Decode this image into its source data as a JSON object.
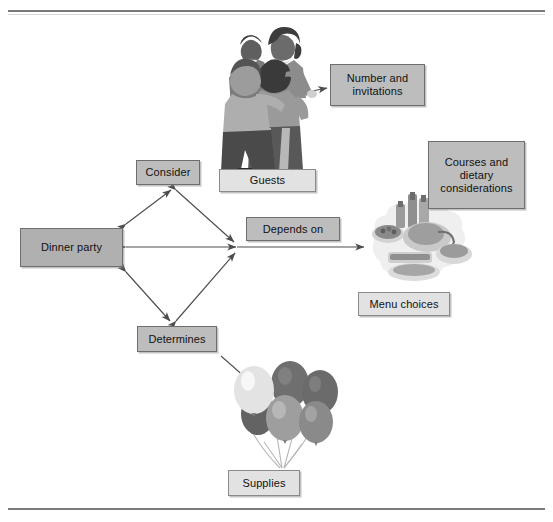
{
  "page": {
    "background": "#ffffff",
    "border_color": "#7a7a7a"
  },
  "diagram": {
    "type": "concept-map",
    "nodes": [
      {
        "id": "dinner-party",
        "label": "Dinner party",
        "shape": "rectangle",
        "fill": "#b0b0b0",
        "x": 20,
        "y": 228,
        "w": 103,
        "h": 39
      },
      {
        "id": "consider",
        "label": "Consider",
        "shape": "rectangle",
        "fill": "#bdbdbd",
        "x": 136,
        "y": 160,
        "w": 64,
        "h": 25
      },
      {
        "id": "determines",
        "label": "Determines",
        "shape": "rectangle",
        "fill": "#bdbdbd",
        "x": 137,
        "y": 326,
        "w": 80,
        "h": 26
      },
      {
        "id": "depends-on",
        "label": "Depends on",
        "shape": "rectangle",
        "fill": "#bdbdbd",
        "x": 246,
        "y": 217,
        "w": 94,
        "h": 24
      },
      {
        "id": "guests",
        "label": "Guests",
        "shape": "rectangle",
        "fill": "#e2e2e2",
        "x": 219,
        "y": 169,
        "w": 97,
        "h": 23
      },
      {
        "id": "number-and-invitations",
        "label": "Number and invitations",
        "lines": [
          "Number and",
          "invitations"
        ],
        "shape": "rectangle",
        "fill": "#bdbdbd",
        "x": 330,
        "y": 64,
        "w": 95,
        "h": 42
      },
      {
        "id": "courses-and-dietary-considerations",
        "label": "Courses and dietary considerations",
        "lines": [
          "Courses and",
          "dietary",
          "considerations"
        ],
        "shape": "rectangle",
        "fill": "#bdbdbd",
        "x": 428,
        "y": 141,
        "w": 97,
        "h": 68
      },
      {
        "id": "menu-choices",
        "label": "Menu choices",
        "shape": "rectangle",
        "fill": "#e2e2e2",
        "x": 358,
        "y": 292,
        "w": 92,
        "h": 24
      },
      {
        "id": "supplies",
        "label": "Supplies",
        "shape": "rectangle",
        "fill": "#e2e2e2",
        "x": 228,
        "y": 470,
        "w": 72,
        "h": 26
      }
    ],
    "edges": [
      {
        "from": "dinner-party",
        "to": "consider",
        "style": "double-arrow"
      },
      {
        "from": "dinner-party",
        "to": "determines",
        "style": "double-arrow"
      },
      {
        "from": "dinner-party",
        "to": "hub",
        "style": "double-arrow",
        "label": "Depends on"
      },
      {
        "from": "consider",
        "to": "hub",
        "style": "double-arrow"
      },
      {
        "from": "determines",
        "to": "hub",
        "style": "double-arrow"
      },
      {
        "from": "guests-image",
        "to": "number-and-invitations",
        "style": "single-arrow"
      },
      {
        "from": "hub",
        "to": "food-image",
        "style": "single-arrow"
      },
      {
        "from": "determines",
        "to": "balloons-image",
        "style": "single-arrow"
      }
    ],
    "images": [
      {
        "id": "guests-image",
        "alt": "illustration of four party guests",
        "x": 216,
        "y": 12,
        "w": 110,
        "h": 160
      },
      {
        "id": "food-image",
        "alt": "illustration of a platter of food and bottles",
        "x": 362,
        "y": 192,
        "w": 120,
        "h": 95
      },
      {
        "id": "balloons-image",
        "alt": "illustration of a bunch of balloons",
        "x": 228,
        "y": 362,
        "w": 110,
        "h": 115
      }
    ]
  },
  "labels": {
    "dinner_party": "Dinner party",
    "consider": "Consider",
    "determines": "Determines",
    "depends_on": "Depends on",
    "guests": "Guests",
    "number_line1": "Number and",
    "number_line2": "invitations",
    "courses_line1": "Courses and",
    "courses_line2": "dietary",
    "courses_line3": "considerations",
    "menu_choices": "Menu choices",
    "supplies": "Supplies"
  },
  "colors": {
    "node_dark": "#b0b0b0",
    "node_mid": "#bdbdbd",
    "node_light": "#e2e2e2",
    "node_border": "#6e6e6e",
    "arrow": "#4d4d4d",
    "rule": "#7a7a7a"
  }
}
